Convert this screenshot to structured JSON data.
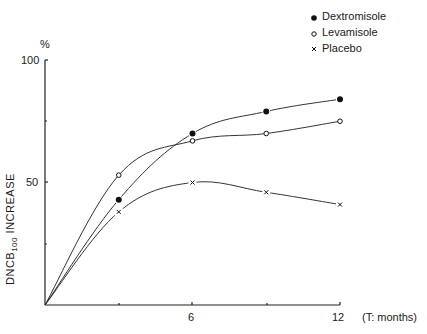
{
  "chart_data": {
    "type": "line",
    "title": "",
    "xlabel": "(T: months)",
    "ylabel": "DNCB100 INCREASE",
    "ylabel_main": "DNCB",
    "ylabel_sub": "100",
    "ylabel_tail": " INCREASE",
    "y_unit": "%",
    "x_ticks": [
      0,
      3,
      6,
      9,
      12
    ],
    "x_tick_labels": [
      "6",
      "12"
    ],
    "y_ticks": [
      0,
      25,
      50,
      75,
      100
    ],
    "y_tick_labels": [
      "50",
      "100"
    ],
    "xlim": [
      0,
      12
    ],
    "ylim": [
      0,
      100
    ],
    "grid": false,
    "legend_position": "top-right",
    "x": [
      0,
      3,
      6,
      9,
      12
    ],
    "series": [
      {
        "name": "Dextromisole",
        "marker": "filled-circle",
        "values": [
          0,
          43,
          70,
          79,
          84
        ]
      },
      {
        "name": "Levamisole",
        "marker": "open-circle",
        "values": [
          0,
          53,
          67,
          70,
          75
        ]
      },
      {
        "name": "Placebo",
        "marker": "x",
        "values": [
          0,
          38,
          50,
          46,
          41
        ]
      }
    ]
  },
  "labels": {
    "y_unit": "%",
    "y100": "100",
    "y50": "50",
    "x6": "6",
    "x12": "12",
    "x_axis_title": "(T: months)"
  },
  "legend": [
    {
      "label": "Dextromisole"
    },
    {
      "label": "Levamisole"
    },
    {
      "label": "Placebo"
    }
  ]
}
